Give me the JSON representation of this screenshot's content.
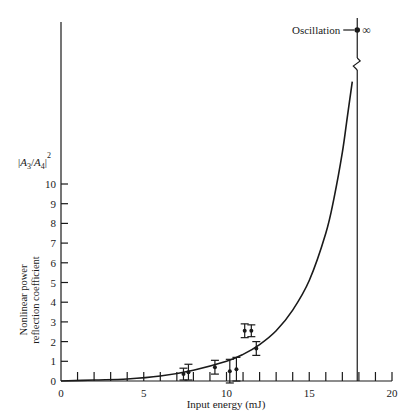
{
  "chart_data": {
    "type": "line",
    "title": "",
    "xlabel": "Input energy (mJ)",
    "ylabel": "Nonlinear power reflection coefficient",
    "ylabel_line1": "Nonlinear power",
    "ylabel_line2": "reflection coefficient",
    "y_quantity": "|A3/A4|^2",
    "xlim": [
      0,
      20
    ],
    "ylim": [
      0,
      10
    ],
    "x_ticks": [
      0,
      5,
      10,
      15,
      20
    ],
    "x_minor_step": 1,
    "y_ticks": [
      0,
      1,
      2,
      3,
      4,
      5,
      6,
      7,
      8,
      9,
      10
    ],
    "grid": false,
    "legend": null,
    "annotations": [
      {
        "text": "Oscillation",
        "symbol": "∞",
        "x": 17.9,
        "note": "divergence at threshold, marked with dot and infinity"
      }
    ],
    "threshold_x": 17.9,
    "series": [
      {
        "name": "Theory curve",
        "kind": "line",
        "x": [
          0,
          2,
          4,
          6,
          8,
          10,
          11,
          12,
          13,
          14,
          15,
          16,
          16.5,
          17,
          17.3,
          17.6
        ],
        "y": [
          0,
          0.05,
          0.1,
          0.25,
          0.55,
          1.0,
          1.35,
          1.85,
          2.55,
          3.6,
          5.1,
          7.5,
          9.3,
          11.6,
          13.4,
          15.2
        ]
      },
      {
        "name": "Experimental data",
        "kind": "scatter_errorbar",
        "x": [
          7.4,
          7.7,
          9.3,
          10.2,
          10.6,
          11.1,
          11.5,
          11.8
        ],
        "y": [
          0.35,
          0.45,
          0.7,
          0.5,
          0.6,
          2.55,
          2.55,
          1.65
        ],
        "yerr": [
          0.3,
          0.4,
          0.35,
          0.6,
          0.6,
          0.35,
          0.3,
          0.35
        ]
      }
    ]
  }
}
